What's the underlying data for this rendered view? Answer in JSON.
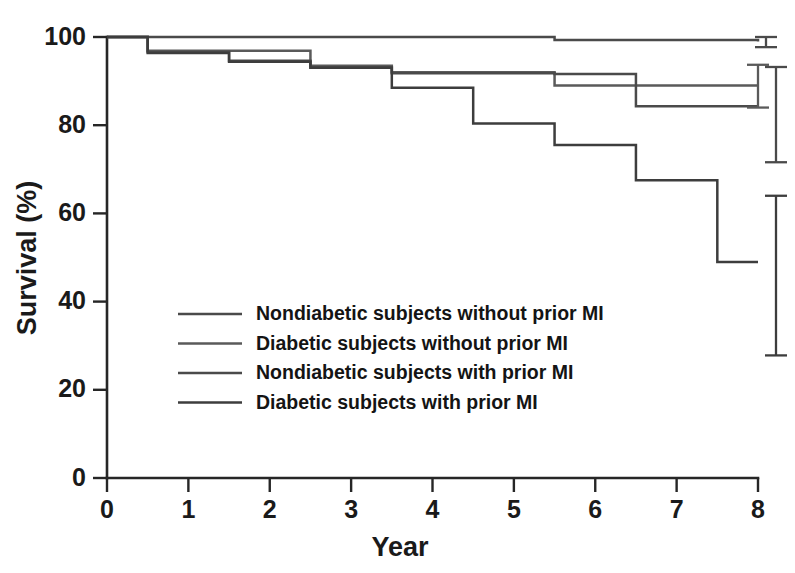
{
  "chart_data": {
    "type": "line",
    "subtype": "kaplan-meier-survival-step",
    "title": "",
    "xlabel": "Year",
    "ylabel": "Survival (%)",
    "xlim": [
      0,
      8
    ],
    "ylim": [
      0,
      100
    ],
    "xticks": [
      0,
      1,
      2,
      3,
      4,
      5,
      6,
      7,
      8
    ],
    "xtick_labels": [
      "0",
      "1",
      "2",
      "3",
      "4",
      "5",
      "6",
      "7",
      "8"
    ],
    "yticks": [
      0,
      20,
      40,
      60,
      80,
      100
    ],
    "ytick_labels": [
      "0",
      "20",
      "40",
      "60",
      "80",
      "100"
    ],
    "grid": false,
    "legend_position": "center-left-inside",
    "line_color": "#3d3d3d",
    "axis_color": "#262626",
    "series": [
      {
        "name": "Nondiabetic subjects without prior MI",
        "color": "#4a4a4a",
        "steps_x": [
          0,
          2.5,
          5.5,
          8
        ],
        "steps_y": [
          100,
          100,
          99.3,
          99.0
        ],
        "final_value": 99.0,
        "error_bar": {
          "x": 8,
          "low": 97.7,
          "high": 100.0
        }
      },
      {
        "name": "Diabetic subjects without prior MI",
        "color": "#5a5a5a",
        "steps_x": [
          0,
          0.5,
          2.5,
          3.5,
          4.5,
          5.5,
          6.5,
          8
        ],
        "steps_y": [
          100,
          96.9,
          93.5,
          92.0,
          92.0,
          89.0,
          89.0,
          89.0
        ],
        "final_value": 89.0,
        "error_bar": {
          "x": 8,
          "low": 84.0,
          "high": 93.7
        }
      },
      {
        "name": "Nondiabetic subjects with prior MI",
        "color": "#4a4a4a",
        "steps_x": [
          0,
          0.5,
          1.5,
          2.5,
          3.5,
          4.5,
          5.5,
          6.5,
          8
        ],
        "steps_y": [
          100,
          96.6,
          94.6,
          93.1,
          91.8,
          91.8,
          91.6,
          84.3,
          84.3
        ],
        "final_value": 84.3,
        "error_bar": {
          "x": 8,
          "low": 71.6,
          "high": 93.2
        }
      },
      {
        "name": "Diabetic subjects with prior MI",
        "color": "#3d3d3d",
        "steps_x": [
          0,
          0.5,
          1.5,
          2.5,
          3.5,
          4.5,
          5.5,
          6.5,
          7.5,
          8
        ],
        "steps_y": [
          100,
          96.4,
          94.4,
          93.0,
          88.5,
          80.4,
          75.5,
          67.5,
          49.0,
          49.0
        ],
        "final_value": 49.0,
        "error_bar": {
          "x": 8,
          "low": 27.8,
          "high": 64.0
        }
      }
    ]
  },
  "legend": {
    "items": [
      {
        "label": "Nondiabetic subjects without prior MI"
      },
      {
        "label": "Diabetic subjects without prior MI"
      },
      {
        "label": "Nondiabetic subjects with prior MI"
      },
      {
        "label": "Diabetic subjects with prior MI"
      }
    ]
  }
}
